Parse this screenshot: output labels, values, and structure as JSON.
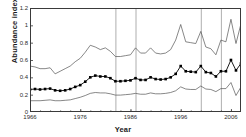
{
  "chart_data": {
    "type": "line",
    "title": "",
    "xlabel": "Year",
    "ylabel": "Abundance index",
    "xlim": [
      1966,
      2008
    ],
    "ylim": [
      0,
      1.2
    ],
    "xticks": [
      1966,
      1976,
      1986,
      1996,
      2006
    ],
    "yticks": [
      "0",
      "0.2",
      "0.4",
      "0.6",
      "0.8",
      "1",
      "1.2"
    ],
    "ytick_values": [
      0,
      0.2,
      0.4,
      0.6,
      0.8,
      1.0,
      1.2
    ],
    "grid": "vertical-only",
    "gridlines_x": [
      1983,
      1987,
      2000,
      2004
    ],
    "legend": "none",
    "line_color": "#000000",
    "bound_color": "#555555",
    "marker": "square",
    "x": [
      1966,
      1967,
      1968,
      1969,
      1970,
      1971,
      1972,
      1973,
      1974,
      1975,
      1976,
      1977,
      1978,
      1979,
      1980,
      1981,
      1982,
      1983,
      1984,
      1985,
      1986,
      1987,
      1988,
      1989,
      1990,
      1991,
      1992,
      1993,
      1994,
      1995,
      1996,
      1997,
      1998,
      1999,
      2000,
      2001,
      2002,
      2003,
      2004,
      2005,
      2006,
      2007,
      2008
    ],
    "series": [
      {
        "name": "Upper confidence bound",
        "style": "thin-line",
        "values": [
          0.53,
          0.52,
          0.5,
          0.5,
          0.51,
          0.44,
          0.47,
          0.5,
          0.53,
          0.58,
          0.62,
          0.69,
          0.77,
          0.75,
          0.72,
          0.74,
          0.7,
          0.64,
          0.64,
          0.65,
          0.66,
          0.74,
          0.68,
          0.68,
          0.74,
          0.68,
          0.67,
          0.68,
          0.72,
          0.83,
          1.01,
          0.81,
          0.8,
          0.79,
          0.93,
          0.75,
          0.73,
          0.66,
          0.83,
          0.81,
          1.07,
          0.79,
          1.02
        ]
      },
      {
        "name": "Abundance index",
        "style": "line-with-square-markers",
        "values": [
          0.26,
          0.265,
          0.26,
          0.265,
          0.27,
          0.25,
          0.245,
          0.25,
          0.265,
          0.29,
          0.31,
          0.35,
          0.4,
          0.42,
          0.41,
          0.41,
          0.39,
          0.355,
          0.355,
          0.36,
          0.365,
          0.39,
          0.37,
          0.37,
          0.4,
          0.38,
          0.375,
          0.38,
          0.4,
          0.44,
          0.53,
          0.47,
          0.465,
          0.46,
          0.53,
          0.46,
          0.45,
          0.41,
          0.47,
          0.47,
          0.6,
          0.48,
          0.56
        ]
      },
      {
        "name": "Lower confidence bound",
        "style": "thin-line",
        "values": [
          0.13,
          0.13,
          0.13,
          0.135,
          0.14,
          0.13,
          0.13,
          0.135,
          0.14,
          0.155,
          0.17,
          0.19,
          0.215,
          0.225,
          0.22,
          0.22,
          0.21,
          0.195,
          0.195,
          0.2,
          0.205,
          0.215,
          0.205,
          0.205,
          0.22,
          0.21,
          0.21,
          0.215,
          0.225,
          0.245,
          0.29,
          0.265,
          0.26,
          0.26,
          0.3,
          0.265,
          0.26,
          0.235,
          0.27,
          0.27,
          0.34,
          0.19,
          0.29
        ]
      }
    ]
  }
}
